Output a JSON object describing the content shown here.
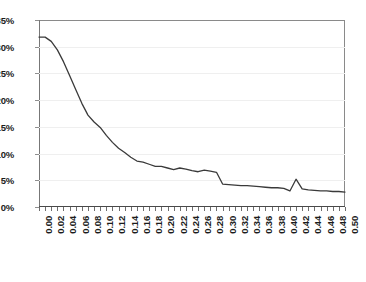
{
  "chart_data": {
    "type": "line",
    "title": "",
    "subtitle": "",
    "xlabel": "",
    "ylabel": "",
    "xlim": [
      0.0,
      0.5
    ],
    "ylim": [
      0,
      35
    ],
    "y_unit": "%",
    "grid": "horizontal",
    "legend": "none",
    "markers": false,
    "line_color": "#3a3a3a",
    "ytick_labels": [
      "35%",
      "30%",
      "25%",
      "20%",
      "15%",
      "10%",
      "5%",
      "0%"
    ],
    "ytick_values": [
      35,
      30,
      25,
      20,
      15,
      10,
      5,
      0
    ],
    "xtick_labels": [
      "0.00",
      "0.02",
      "0.04",
      "0.06",
      "0.08",
      "0.10",
      "0.12",
      "0.14",
      "0.16",
      "0.18",
      "0.20",
      "0.22",
      "0.24",
      "0.26",
      "0.28",
      "0.30",
      "0.32",
      "0.34",
      "0.36",
      "0.38",
      "0.40",
      "0.42",
      "0.44",
      "0.46",
      "0.48",
      "0.50"
    ],
    "xtick_values": [
      0.0,
      0.02,
      0.04,
      0.06,
      0.08,
      0.1,
      0.12,
      0.14,
      0.16,
      0.18,
      0.2,
      0.22,
      0.24,
      0.26,
      0.28,
      0.3,
      0.32,
      0.34,
      0.36,
      0.38,
      0.4,
      0.42,
      0.44,
      0.46,
      0.48,
      0.5
    ],
    "xtick_step_minor": 0.01,
    "series": [
      {
        "name": "series-1",
        "x": [
          0.0,
          0.01,
          0.02,
          0.03,
          0.04,
          0.05,
          0.06,
          0.07,
          0.08,
          0.09,
          0.1,
          0.11,
          0.12,
          0.13,
          0.14,
          0.15,
          0.16,
          0.17,
          0.18,
          0.19,
          0.2,
          0.21,
          0.22,
          0.23,
          0.24,
          0.25,
          0.26,
          0.27,
          0.28,
          0.29,
          0.3,
          0.31,
          0.32,
          0.33,
          0.34,
          0.35,
          0.36,
          0.37,
          0.38,
          0.39,
          0.4,
          0.41,
          0.42,
          0.43,
          0.44,
          0.45,
          0.46,
          0.47,
          0.48,
          0.49,
          0.5
        ],
        "y": [
          31.8,
          31.8,
          31.0,
          29.4,
          27.2,
          24.6,
          22.0,
          19.4,
          17.2,
          15.9,
          14.9,
          13.4,
          12.1,
          11.0,
          10.2,
          9.3,
          8.6,
          8.4,
          8.0,
          7.6,
          7.6,
          7.3,
          7.0,
          7.3,
          7.1,
          6.8,
          6.6,
          6.9,
          6.7,
          6.5,
          4.3,
          4.2,
          4.1,
          4.0,
          4.0,
          3.9,
          3.8,
          3.7,
          3.6,
          3.6,
          3.5,
          3.0,
          5.2,
          3.4,
          3.2,
          3.1,
          3.0,
          3.0,
          2.9,
          2.9,
          2.8
        ]
      }
    ]
  }
}
